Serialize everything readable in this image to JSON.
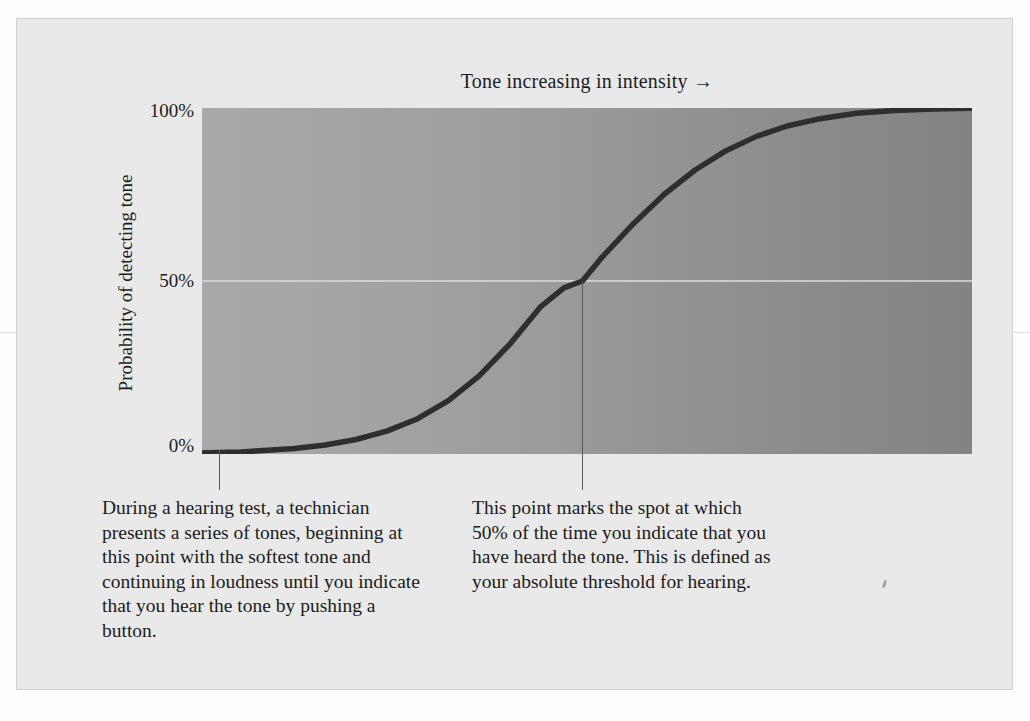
{
  "figure": {
    "title": "Tone increasing in intensity →",
    "y_axis_title": "Probability of detecting tone",
    "caption_left": "During a hearing test, a technician presents a series of tones, beginning at this point with the softest tone and continuing in loudness until you indicate that you hear the tone by pushing a button.",
    "caption_right": "This point marks the spot at which 50% of the time you indicate that you have heard the tone. This is defined as your absolute threshold for hearing."
  },
  "colors": {
    "page_background": "#fdfdfd",
    "card_background": "#e9e9e9",
    "plot_gradient_left": "#a9a9a9",
    "plot_gradient_right": "#838383",
    "curve": "#2e2e2e",
    "gridline": "#dcdcdc",
    "leader_line": "#5b5b5b",
    "text": "#1b1b1b"
  },
  "chart_data": {
    "type": "line",
    "title": "Tone increasing in intensity →",
    "xlabel": "Tone increasing in intensity →",
    "ylabel": "Probability of detecting tone",
    "ylim": [
      0,
      100
    ],
    "xlim": [
      0,
      100
    ],
    "ytick_labels": [
      "100%",
      "50%",
      "0%"
    ],
    "ytick_values": [
      100,
      50,
      0
    ],
    "xtick_labels": [],
    "grid": "horizontal gridline at 50% only",
    "legend": "none",
    "series": [
      {
        "name": "Psychometric function (probability of detecting tone)",
        "x": [
          0,
          2,
          5,
          8,
          12,
          16,
          20,
          24,
          28,
          32,
          36,
          40,
          44,
          47,
          49.4,
          52,
          56,
          60,
          64,
          68,
          72,
          76,
          80,
          85,
          90,
          95,
          100
        ],
        "values": [
          0.3,
          0.4,
          0.6,
          1.0,
          1.6,
          2.6,
          4.2,
          6.6,
          10.2,
          15.4,
          22.6,
          31.8,
          42.6,
          48.0,
          50.0,
          57.0,
          66.5,
          75.0,
          82.0,
          87.6,
          91.8,
          94.8,
          96.8,
          98.5,
          99.3,
          99.7,
          99.9
        ]
      }
    ],
    "annotations": [
      {
        "name": "start-of-test-marker",
        "x": 2.2,
        "y": 0,
        "leader": "vertical line descending from curve to caption below plot",
        "caption": "During a hearing test, a technician presents a series of tones, beginning at this point with the softest tone and continuing in loudness until you indicate that you hear the tone by pushing a button."
      },
      {
        "name": "absolute-threshold-marker",
        "x": 49.4,
        "y": 50,
        "leader": "vertical line descending from the 50% crossing to caption below plot",
        "caption": "This point marks the spot at which 50% of the time you indicate that you have heard the tone. This is defined as your absolute threshold for hearing."
      }
    ]
  }
}
